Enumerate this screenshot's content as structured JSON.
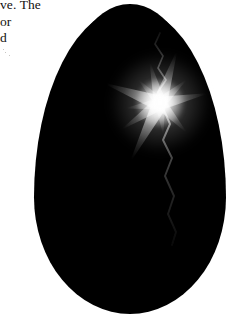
{
  "page": {
    "width": 235,
    "height": 322,
    "background_color": "#ffffff",
    "media_type": "scanned-book-page-with-figure"
  },
  "text_block": {
    "name": "body-text-excerpt",
    "note": "serif body copy clipped by the left page margin",
    "text_color": "#13110f",
    "lines": [
      "ve. The",
      "or",
      "d"
    ]
  },
  "figure": {
    "name": "egg-with-starburst",
    "caption": "",
    "egg": {
      "label": "egg-silhouette",
      "fill_color": "#000000",
      "left": 34,
      "top": 7,
      "width": 192,
      "height": 307
    },
    "starburst": {
      "label": "starburst-flare",
      "color": "#ffffff",
      "center_x": 160,
      "center_y": 103,
      "spike_count": 11,
      "spikes": [
        {
          "angle": 12,
          "length": 46,
          "width": 13
        },
        {
          "angle": 42,
          "length": 34,
          "width": 11
        },
        {
          "angle": 72,
          "length": 52,
          "width": 14
        },
        {
          "angle": 104,
          "length": 40,
          "width": 12
        },
        {
          "angle": 133,
          "length": 30,
          "width": 10
        },
        {
          "angle": 160,
          "length": 56,
          "width": 15
        },
        {
          "angle": 188,
          "length": 33,
          "width": 11
        },
        {
          "angle": 214,
          "length": 44,
          "width": 13
        },
        {
          "angle": 243,
          "length": 62,
          "width": 15
        },
        {
          "angle": 276,
          "length": 30,
          "width": 10
        },
        {
          "angle": 312,
          "length": 38,
          "width": 12
        }
      ]
    },
    "crack": {
      "label": "crack-fracture-line",
      "color": "#7d7d7d",
      "path_upper": "M 163 104 L 158 92 L 166 80 L 158 68 L 163 56 L 155 44 L 160 33",
      "path_lower": "M 163 108 L 170 124 L 163 140 L 172 158 L 165 176 L 174 196 L 168 214 L 176 232 L 172 245"
    }
  },
  "scan_artifacts": {
    "label": "paper-speckle",
    "color": "#9a9792",
    "specks": [
      {
        "x": 5,
        "y": 52,
        "w": 1,
        "h": 1
      },
      {
        "x": 9,
        "y": 55,
        "w": 1,
        "h": 1
      },
      {
        "x": 3,
        "y": 49,
        "w": 1,
        "h": 1
      }
    ]
  }
}
